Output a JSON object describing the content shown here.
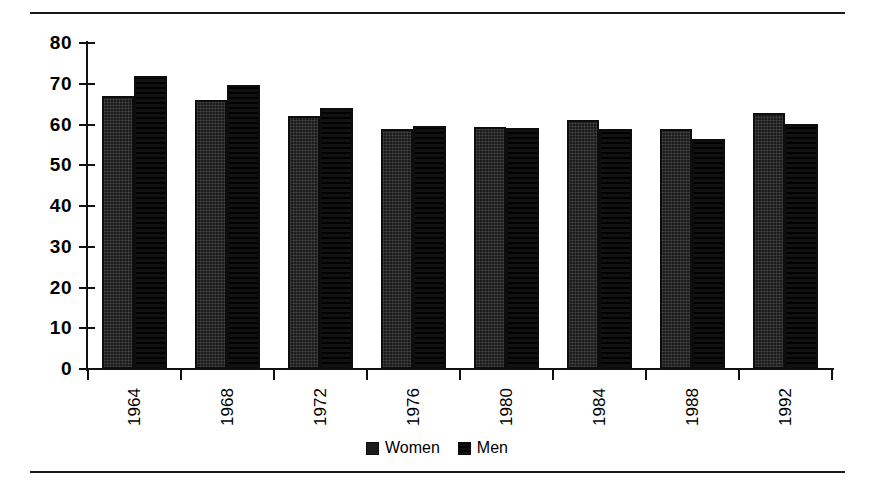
{
  "chart_data": {
    "type": "bar",
    "title": "",
    "subtitle": "",
    "xlabel": "",
    "ylabel": "",
    "ylim": [
      0,
      80
    ],
    "yticks": [
      0,
      10,
      20,
      30,
      40,
      50,
      60,
      70,
      80
    ],
    "grid": false,
    "legend_position": "bottom-center",
    "categories": [
      "1964",
      "1968",
      "1972",
      "1976",
      "1980",
      "1984",
      "1988",
      "1992"
    ],
    "series": [
      {
        "name": "Women",
        "pattern": "solid",
        "color": "#1c1c1c",
        "values": [
          67.0,
          66.0,
          62.0,
          59.0,
          59.4,
          61.0,
          58.8,
          62.8
        ]
      },
      {
        "name": "Men",
        "pattern": "grid",
        "color": "#111111",
        "values": [
          71.9,
          69.8,
          64.1,
          59.6,
          59.1,
          59.0,
          56.4,
          60.2
        ]
      }
    ]
  },
  "axes": {
    "y_tick_labels": [
      "80",
      "70",
      "60",
      "50",
      "40",
      "30",
      "20",
      "10",
      "0"
    ],
    "x_tick_labels": [
      "1964",
      "1968",
      "1972",
      "1976",
      "1980",
      "1984",
      "1988",
      "1992"
    ]
  },
  "legend": {
    "items": [
      {
        "label": "Women",
        "swatch": "solid-black-swatch"
      },
      {
        "label": "Men",
        "swatch": "grid-pattern-swatch"
      }
    ]
  },
  "frame": {
    "top_rule": "horizontal-rule",
    "bottom_rule": "horizontal-rule"
  }
}
